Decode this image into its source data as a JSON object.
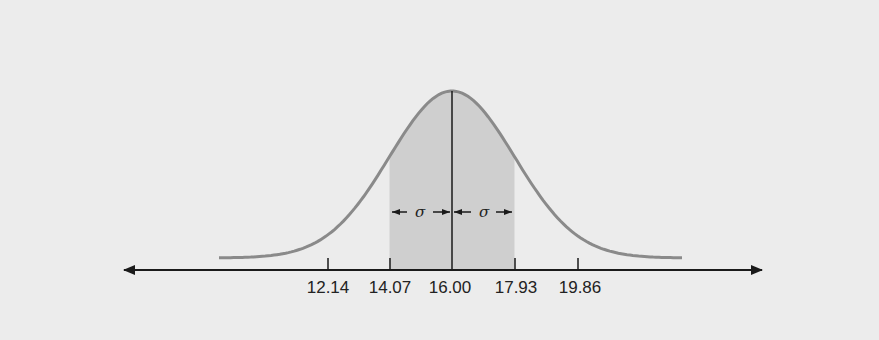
{
  "chart_data": {
    "type": "area",
    "title": "",
    "xlabel": "",
    "ylabel": "",
    "distribution": "normal",
    "mean": 16.0,
    "std_dev": 1.93,
    "tick_labels": [
      "12.14",
      "14.07",
      "16.00",
      "17.93",
      "19.86"
    ],
    "tick_values": [
      12.14,
      14.07,
      16.0,
      17.93,
      19.86
    ],
    "shaded_region": {
      "from": 14.07,
      "to": 17.93,
      "label": "mean ± 1σ"
    },
    "annotations": [
      {
        "text": "σ",
        "from": 14.07,
        "to": 16.0
      },
      {
        "text": "σ",
        "from": 16.0,
        "to": 17.93
      }
    ],
    "mean_line": 16.0,
    "axis_arrows": "both",
    "grid": false,
    "legend": null
  },
  "labels": {
    "tick_0": "12.14",
    "tick_1": "14.07",
    "tick_2": "16.00",
    "tick_3": "17.93",
    "tick_4": "19.86",
    "sigma_left": "σ",
    "sigma_right": "σ"
  },
  "colors": {
    "background": "#ececec",
    "shaded": "#cfcfcf",
    "curve": "#8a8a8a",
    "axis": "#1a1a1a"
  }
}
